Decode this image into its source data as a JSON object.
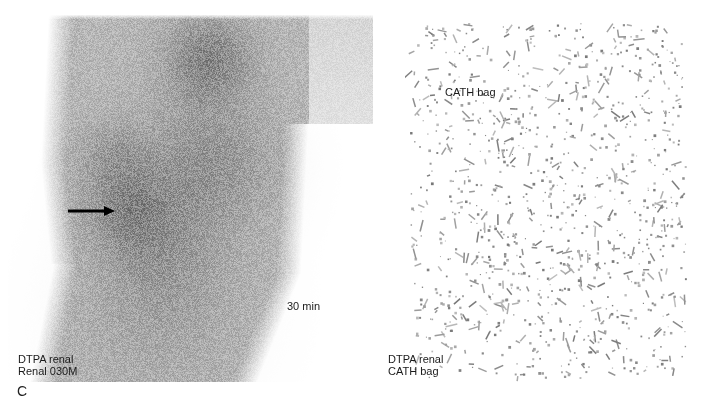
{
  "figure": {
    "panel_letter": "C",
    "left_panel": {
      "description": "posterior scintigraphic image, diffuse grey tracer uptake",
      "time_label": "30 min",
      "caption_line1": "DTPA renal",
      "caption_line2": "Renal 030M",
      "arrow": "right-pointing-arrow"
    },
    "right_panel": {
      "description": "sparse count image of catheter bag",
      "top_label": "CATH bag",
      "caption_line1": "DTPA renal",
      "caption_line2": "CATH bag"
    }
  },
  "colors": {
    "background": "#ffffff",
    "uptake_grey": "#6b6b6b",
    "text": "#1a1a1a"
  }
}
